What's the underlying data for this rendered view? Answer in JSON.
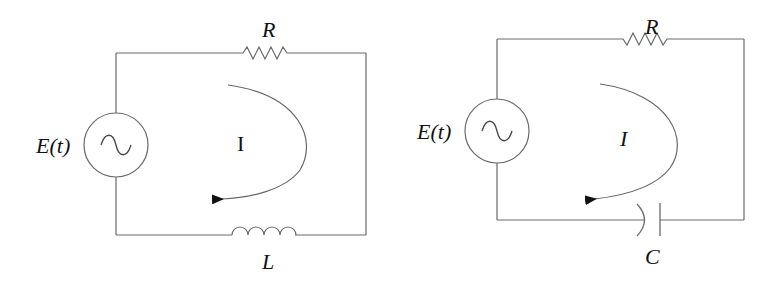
{
  "diagrams": [
    {
      "name": "RL circuit",
      "source_label": "E(t)",
      "resistor_label": "R",
      "inductor_label": "L",
      "current_label": "I"
    },
    {
      "name": "RC circuit",
      "source_label": "E(t)",
      "resistor_label": "R",
      "capacitor_label": "C",
      "current_label": "I"
    }
  ],
  "colors": {
    "wire": "#6a6a6a",
    "text": "#111111",
    "background": "#ffffff"
  }
}
